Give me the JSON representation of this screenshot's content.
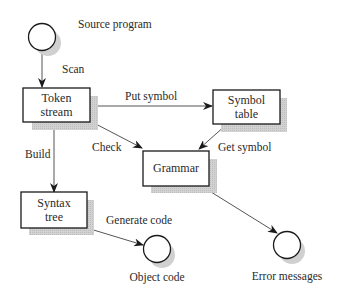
{
  "diagram": {
    "type": "flowchart",
    "title": "",
    "nodes": [
      {
        "id": "source",
        "shape": "circle",
        "label": "Source program"
      },
      {
        "id": "token",
        "shape": "box",
        "label_line1": "Token",
        "label_line2": "stream"
      },
      {
        "id": "symtab",
        "shape": "box",
        "label_line1": "Symbol",
        "label_line2": "table"
      },
      {
        "id": "grammar",
        "shape": "box",
        "label_line1": "Grammar"
      },
      {
        "id": "syntax",
        "shape": "box",
        "label_line1": "Syntax",
        "label_line2": "tree"
      },
      {
        "id": "object",
        "shape": "circle",
        "label": "Object code"
      },
      {
        "id": "errors",
        "shape": "circle",
        "label": "Error messages"
      }
    ],
    "edges": [
      {
        "from": "source",
        "to": "token",
        "label": "Scan"
      },
      {
        "from": "token",
        "to": "symtab",
        "label": "Put symbol"
      },
      {
        "from": "token",
        "to": "grammar",
        "label": "Check"
      },
      {
        "from": "symtab",
        "to": "grammar",
        "label": "Get symbol"
      },
      {
        "from": "token",
        "to": "syntax",
        "label": "Build"
      },
      {
        "from": "syntax",
        "to": "object",
        "label": "Generate code"
      },
      {
        "from": "grammar",
        "to": "errors",
        "label": ""
      }
    ]
  },
  "colors": {
    "stroke": "#1a1a1a",
    "shadow": "#c8c8c8",
    "edge": "#555555",
    "background": "#ffffff"
  }
}
